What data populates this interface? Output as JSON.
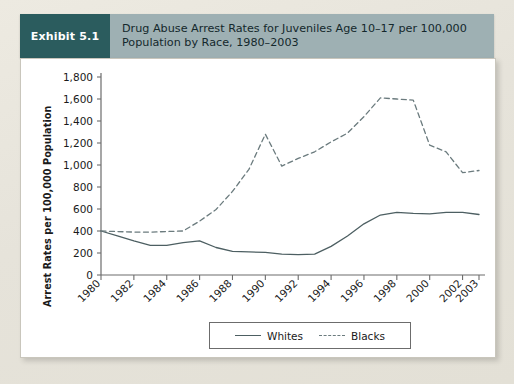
{
  "exhibit": {
    "tag": "Exhibit 5.1",
    "title": "Drug Abuse Arrest Rates for Juveniles Age 10–17 per 100,000 Population by Race, 1980–2003"
  },
  "colors": {
    "tag_bg": "#2b5c5e",
    "header_bg": "#9eb0b3",
    "panel_bg": "#ffffff",
    "page_bg": "#e9e6dd",
    "whites_line": "#4d5f62",
    "blacks_line": "#6b7b7e",
    "axis": "#6c6c6c"
  },
  "chart_data": {
    "type": "line",
    "title": "Drug Abuse Arrest Rates for Juveniles Age 10–17 per 100,000 Population by Race, 1980–2003",
    "xlabel": "",
    "ylabel": "Arrest Rates per 100,000 Population",
    "ylim": [
      0,
      1800
    ],
    "ytick_step": 200,
    "yticks": [
      0,
      200,
      400,
      600,
      800,
      1000,
      1200,
      1400,
      1600,
      1800
    ],
    "ytick_labels": [
      "0",
      "200",
      "400",
      "600",
      "800",
      "1,000",
      "1,200",
      "1,400",
      "1,600",
      "1,800"
    ],
    "xlim": [
      1980,
      2003
    ],
    "x": [
      1980,
      1981,
      1982,
      1983,
      1984,
      1985,
      1986,
      1987,
      1988,
      1989,
      1990,
      1991,
      1992,
      1993,
      1994,
      1995,
      1996,
      1997,
      1998,
      1999,
      2000,
      2001,
      2002,
      2003
    ],
    "xtick_labels": [
      "1980",
      "1982",
      "1984",
      "1986",
      "1988",
      "1990",
      "1992",
      "1994",
      "1996",
      "1998",
      "2000",
      "2002",
      "2003"
    ],
    "xticks": [
      1980,
      1982,
      1984,
      1986,
      1988,
      1990,
      1992,
      1994,
      1996,
      1998,
      2000,
      2002,
      2003
    ],
    "xtick_rotation": 45,
    "grid": false,
    "legend_position": "bottom-center",
    "series": [
      {
        "name": "Whites",
        "style": "solid",
        "color": "#4d5f62",
        "values": [
          400,
          355,
          310,
          270,
          270,
          295,
          310,
          250,
          215,
          210,
          205,
          190,
          185,
          190,
          260,
          355,
          465,
          545,
          570,
          560,
          555,
          570,
          570,
          550
        ]
      },
      {
        "name": "Blacks",
        "style": "dashed",
        "color": "#6b7b7e",
        "values": [
          400,
          395,
          390,
          390,
          395,
          400,
          490,
          595,
          760,
          960,
          1280,
          990,
          1060,
          1120,
          1210,
          1290,
          1440,
          1610,
          1600,
          1590,
          1180,
          1120,
          930,
          950
        ]
      }
    ],
    "annotations": [
      {
        "text": "Blacks peak 1989–1990",
        "x": 1989.5,
        "y": 1280
      },
      {
        "text": "Blacks peak 1996–1998",
        "x": 1996.5,
        "y": 1610
      }
    ]
  },
  "legend": {
    "items": [
      {
        "label": "Whites",
        "style": "solid"
      },
      {
        "label": "Blacks",
        "style": "dashed"
      }
    ]
  }
}
